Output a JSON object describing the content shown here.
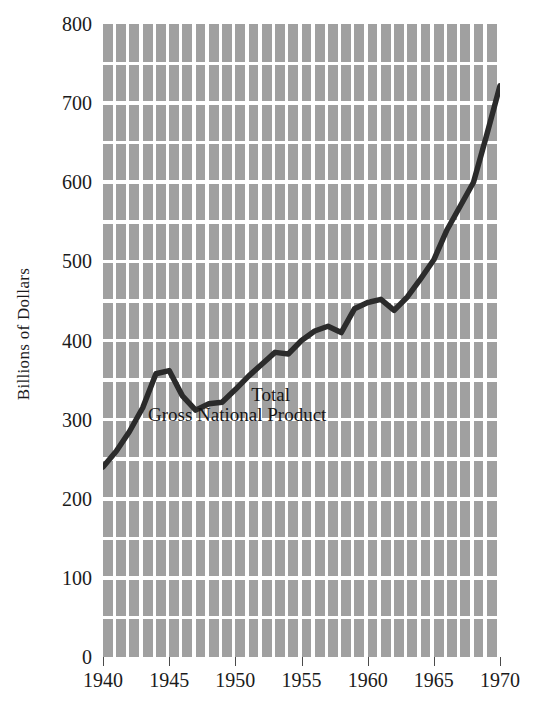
{
  "chart_data": {
    "type": "line",
    "title": "",
    "xlabel": "",
    "ylabel": "Billions of Dollars",
    "xlim": [
      1940,
      1970
    ],
    "ylim": [
      0,
      800
    ],
    "grid": true,
    "legend_position": "inline-annotation",
    "annotation_line1": "Total",
    "annotation_line2": "Gross National Product",
    "series_name": "Total Gross National Product",
    "line_color": "#2b2b2b",
    "grid_color": "#a0a0a0",
    "background_color": "#ffffff",
    "xticks": [
      "1940",
      "1945",
      "1950",
      "1955",
      "1960",
      "1965",
      "1970"
    ],
    "yticks": [
      "0",
      "100",
      "200",
      "300",
      "400",
      "500",
      "600",
      "700",
      "800"
    ],
    "x": [
      1940,
      1941,
      1942,
      1943,
      1944,
      1945,
      1946,
      1947,
      1948,
      1949,
      1950,
      1951,
      1952,
      1953,
      1954,
      1955,
      1956,
      1957,
      1958,
      1959,
      1960,
      1961,
      1962,
      1963,
      1964,
      1965,
      1966,
      1967,
      1968,
      1969,
      1970
    ],
    "values": [
      240,
      260,
      285,
      315,
      358,
      362,
      330,
      312,
      320,
      322,
      338,
      355,
      370,
      385,
      383,
      400,
      412,
      418,
      410,
      440,
      448,
      452,
      438,
      455,
      478,
      502,
      540,
      570,
      600,
      660,
      722
    ],
    "unit": "Billions of Dollars"
  },
  "axis": {
    "y_title": "Billions of Dollars"
  }
}
